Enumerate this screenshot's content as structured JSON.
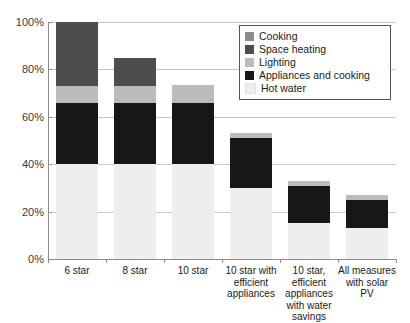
{
  "chart_data": {
    "type": "bar",
    "stacked": true,
    "title": "",
    "subtitle": "",
    "xlabel": "",
    "ylabel": "",
    "ylim": [
      0,
      100
    ],
    "y_tick_labels": [
      "0%",
      "20%",
      "40%",
      "60%",
      "80%",
      "100%"
    ],
    "y_tick_values": [
      0,
      20,
      40,
      60,
      80,
      100
    ],
    "grid": true,
    "legend_position": "top-right",
    "categories": [
      "6 star",
      "8 star",
      "10 star",
      "10 star with efficient appliances",
      "10 star, efficient appliances with water savings",
      "All measures with solar PV"
    ],
    "series": [
      {
        "name": "Hot water",
        "color": "#eeeeee",
        "values": [
          40,
          40,
          40,
          30,
          15,
          13
        ]
      },
      {
        "name": "Appliances and cooking",
        "color": "#171717",
        "values": [
          26,
          26,
          26,
          21,
          16,
          12
        ]
      },
      {
        "name": "Lighting",
        "color": "#bcbcbc",
        "values": [
          7,
          7,
          7.5,
          2,
          2,
          2
        ]
      },
      {
        "name": "Space heating",
        "color": "#4d4d4d",
        "values": [
          27,
          12,
          0,
          0,
          0,
          0
        ]
      },
      {
        "name": "Cooking",
        "color": "#8c8c8c",
        "values": [
          0,
          0,
          0,
          0,
          0,
          0
        ]
      }
    ],
    "totals": [
      100,
      85,
      73.5,
      53,
      33,
      27
    ]
  },
  "legend": {
    "items": [
      {
        "label": "Cooking",
        "color": "#8c8c8c"
      },
      {
        "label": "Space heating",
        "color": "#4d4d4d"
      },
      {
        "label": "Lighting",
        "color": "#bcbcbc"
      },
      {
        "label": "Appliances and cooking",
        "color": "#171717"
      },
      {
        "label": "Hot water",
        "color": "#eeeeee"
      }
    ]
  },
  "axes": {
    "y_ticks": [
      "100%",
      "80%",
      "60%",
      "40%",
      "20%",
      "0%"
    ],
    "x_ticks": [
      "6 star",
      "8 star",
      "10 star",
      "10 star with efficient appliances",
      "10 star, efficient appliances with water savings",
      "All measures with solar PV"
    ]
  }
}
